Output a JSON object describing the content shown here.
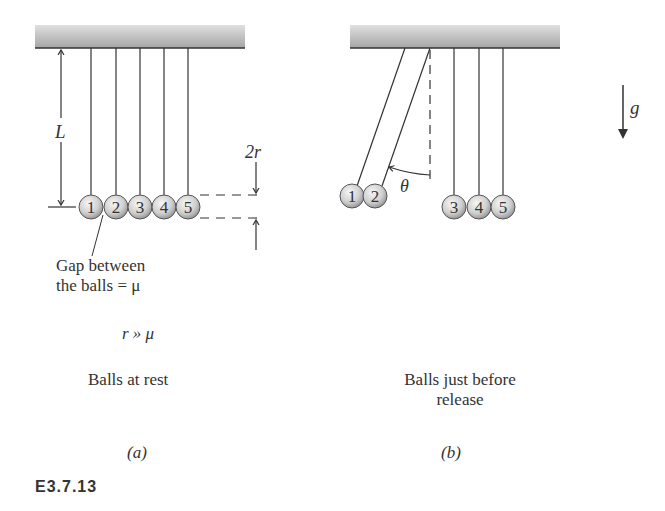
{
  "figure": {
    "id": "E3.7.13",
    "colors": {
      "ceiling_top": "#d9d9d9",
      "ceiling_bottom": "#a8a8a8",
      "line": "#333333",
      "ball_light": "#f2f2f2",
      "ball_dark": "#9a9a9a"
    },
    "panel_a": {
      "ball_labels": [
        "1",
        "2",
        "3",
        "4",
        "5"
      ],
      "length_label": "L",
      "diameter_label": "2r",
      "gap_label_line1": "Gap between",
      "gap_label_line2": "the balls = μ",
      "condition": "r » μ",
      "caption": "Balls at rest",
      "panel_tag": "(a)"
    },
    "panel_b": {
      "ball_labels": [
        "1",
        "2",
        "3",
        "4",
        "5"
      ],
      "angle_label": "θ",
      "gravity_label": "g",
      "caption_line1": "Balls just before",
      "caption_line2": "release",
      "panel_tag": "(b)"
    }
  }
}
